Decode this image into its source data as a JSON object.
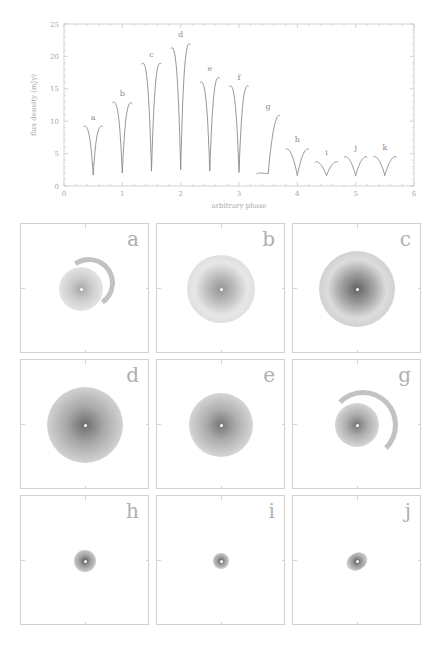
{
  "chart_data": [
    {
      "type": "line",
      "title": "",
      "xlabel": "arbitrary phase",
      "ylabel": "flux density (mJy)",
      "xlim": [
        0,
        6
      ],
      "ylim": [
        0,
        25
      ],
      "x_ticks": [
        "0",
        "1",
        "2",
        "3",
        "4",
        "5",
        "6"
      ],
      "y_ticks": [
        "0",
        "5",
        "10",
        "15",
        "20",
        "25"
      ],
      "grid": false,
      "legend": null,
      "series": [
        {
          "name": "a",
          "center": 0.5,
          "left_max": 9.3,
          "right_max": 9.3,
          "min": 1.7
        },
        {
          "name": "b",
          "center": 1.0,
          "left_max": 13.0,
          "right_max": 12.9,
          "min": 2.0
        },
        {
          "name": "c",
          "center": 1.5,
          "left_max": 19.0,
          "right_max": 19.0,
          "min": 2.3
        },
        {
          "name": "d",
          "center": 2.0,
          "left_max": 21.4,
          "right_max": 22.0,
          "min": 2.5
        },
        {
          "name": "e",
          "center": 2.5,
          "left_max": 16.1,
          "right_max": 16.8,
          "min": 2.3
        },
        {
          "name": "f",
          "center": 3.0,
          "left_max": 15.5,
          "right_max": 15.5,
          "min": 2.1
        },
        {
          "name": "g",
          "center": 3.5,
          "left_max": 2.0,
          "right_max": 11.0,
          "min": 1.9
        },
        {
          "name": "h",
          "center": 4.0,
          "left_max": 5.8,
          "right_max": 5.8,
          "min": 1.6
        },
        {
          "name": "i",
          "center": 4.5,
          "left_max": 3.8,
          "right_max": 3.8,
          "min": 1.6
        },
        {
          "name": "j",
          "center": 5.0,
          "left_max": 4.6,
          "right_max": 4.6,
          "min": 1.6
        },
        {
          "name": "k",
          "center": 5.5,
          "left_max": 4.6,
          "right_max": 4.6,
          "min": 1.6
        }
      ],
      "annotations": [
        "a",
        "b",
        "c",
        "d",
        "e",
        "f",
        "g",
        "h",
        "i",
        "j",
        "k"
      ]
    },
    {
      "type": "heatmap",
      "title": "image panels",
      "layout": "3x3 grid",
      "panels": [
        {
          "label": "a",
          "size": 0.55,
          "shape": "crescent-spiral",
          "intensity": 0.45
        },
        {
          "label": "b",
          "size": 0.85,
          "shape": "disk-ring",
          "intensity": 0.55
        },
        {
          "label": "c",
          "size": 0.95,
          "shape": "disk-ring",
          "intensity": 0.8
        },
        {
          "label": "d",
          "size": 0.95,
          "shape": "disk",
          "intensity": 0.75
        },
        {
          "label": "e",
          "size": 0.8,
          "shape": "disk",
          "intensity": 0.7
        },
        {
          "label": "g",
          "size": 0.55,
          "shape": "disk-arc",
          "intensity": 0.7
        },
        {
          "label": "h",
          "size": 0.28,
          "shape": "compact",
          "intensity": 0.85
        },
        {
          "label": "i",
          "size": 0.2,
          "shape": "compact",
          "intensity": 0.85
        },
        {
          "label": "j",
          "size": 0.28,
          "shape": "compact-elongated",
          "intensity": 0.85
        }
      ]
    }
  ],
  "chart": {
    "xlabel": "arbitrary phase",
    "ylabel": "flux density (mJy)",
    "x_ticks": [
      "0",
      "1",
      "2",
      "3",
      "4",
      "5",
      "6"
    ],
    "y_ticks": [
      "0",
      "5",
      "10",
      "15",
      "20",
      "25"
    ]
  },
  "panels": {
    "labels": [
      "a",
      "b",
      "c",
      "d",
      "e",
      "g",
      "h",
      "i",
      "j"
    ]
  },
  "colors": {
    "axis": "#c8c8c8",
    "curve": "#8a8a8a",
    "text": "#a8a8a8",
    "blob": "#5a5a5a"
  }
}
